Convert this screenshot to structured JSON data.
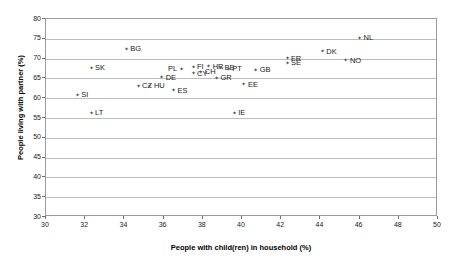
{
  "chart_data": {
    "type": "scatter",
    "title": "",
    "xlabel": "People with child(ren) in household (%)",
    "ylabel": "People living with partner (%)",
    "xlim": [
      30,
      50
    ],
    "ylim": [
      30,
      80
    ],
    "xticks": [
      30,
      32,
      34,
      36,
      38,
      40,
      42,
      44,
      46,
      48,
      50
    ],
    "yticks": [
      30,
      35,
      40,
      45,
      50,
      55,
      60,
      65,
      70,
      75,
      80
    ],
    "grid": "horizontal",
    "legend": "none",
    "marker_color": "#555555",
    "gridline_color": "#bdbdbd",
    "points": [
      {
        "label": "SI",
        "x": 31.6,
        "y": 60.8,
        "side": "right"
      },
      {
        "label": "SK",
        "x": 32.3,
        "y": 67.6,
        "side": "right"
      },
      {
        "label": "LT",
        "x": 32.3,
        "y": 56.2,
        "side": "right"
      },
      {
        "label": "BG",
        "x": 34.1,
        "y": 72.3,
        "side": "right"
      },
      {
        "label": "CZ",
        "x": 34.7,
        "y": 63.0,
        "side": "right"
      },
      {
        "label": "HU",
        "x": 35.3,
        "y": 63.0,
        "side": "right"
      },
      {
        "label": "DE",
        "x": 35.9,
        "y": 65.2,
        "side": "right"
      },
      {
        "label": "ES",
        "x": 36.5,
        "y": 61.9,
        "side": "right"
      },
      {
        "label": "PL",
        "x": 36.9,
        "y": 67.3,
        "side": "left"
      },
      {
        "label": "FI",
        "x": 37.5,
        "y": 67.8,
        "side": "right"
      },
      {
        "label": "CY",
        "x": 37.5,
        "y": 66.2,
        "side": "right"
      },
      {
        "label": "CH",
        "x": 37.9,
        "y": 66.6,
        "side": "right"
      },
      {
        "label": "HR",
        "x": 38.3,
        "y": 68.0,
        "side": "right"
      },
      {
        "label": "GR",
        "x": 38.7,
        "y": 65.1,
        "side": "right"
      },
      {
        "label": "BE",
        "x": 38.9,
        "y": 67.6,
        "side": "right"
      },
      {
        "label": "PT",
        "x": 39.3,
        "y": 67.3,
        "side": "right"
      },
      {
        "label": "IE",
        "x": 39.6,
        "y": 56.2,
        "side": "right"
      },
      {
        "label": "EE",
        "x": 40.1,
        "y": 63.4,
        "side": "right"
      },
      {
        "label": "GB",
        "x": 40.7,
        "y": 67.1,
        "side": "right"
      },
      {
        "label": "FR",
        "x": 42.3,
        "y": 69.9,
        "side": "right"
      },
      {
        "label": "SE",
        "x": 42.3,
        "y": 68.8,
        "side": "right"
      },
      {
        "label": "DK",
        "x": 44.1,
        "y": 71.7,
        "side": "right"
      },
      {
        "label": "NO",
        "x": 45.3,
        "y": 69.5,
        "side": "right"
      },
      {
        "label": "NL",
        "x": 46.0,
        "y": 75.1,
        "side": "right"
      }
    ]
  }
}
